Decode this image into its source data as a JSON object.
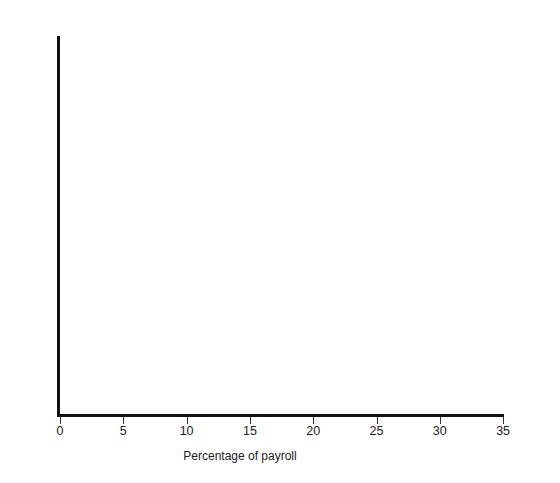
{
  "chart_data": {
    "type": "bar",
    "orientation": "horizontal",
    "stacked": true,
    "title": "",
    "xlabel": "Percentage of payroll",
    "ylabel": "",
    "xlim": [
      0,
      35
    ],
    "xticks": [
      0,
      5,
      10,
      15,
      20,
      25,
      30,
      35
    ],
    "grid": false,
    "legend_position": "right",
    "categories": [
      "1964",
      "1966",
      "1968",
      "1970",
      "1972",
      "1974",
      "1976",
      "1978",
      "1980",
      "1982",
      "1984"
    ],
    "series": [
      {
        "name": "A",
        "label": "Legally required payments",
        "values": [
          2.0,
          1.5,
          1.5,
          1.8,
          1.8,
          2.0,
          2.4,
          3.0,
          2.8,
          2.6,
          4.5
        ]
      },
      {
        "name": "B",
        "label": "Pension and other agreed-upon payments",
        "values": [
          8.7,
          7.7,
          9.5,
          10.6,
          11.4,
          10.5,
          10.5,
          12.7,
          13.5,
          12.7,
          10.4
        ]
      },
      {
        "name": "C",
        "label": "Paid rest periods, lunch periods, etc.",
        "values": [
          3.6,
          3.7,
          3.2,
          3.6,
          4.8,
          3.7,
          4.4,
          3.8,
          4.0,
          4.0,
          3.5
        ]
      },
      {
        "name": "D",
        "label": "Payments for time not worked",
        "values": [
          8.3,
          8.7,
          9.8,
          9.8,
          9.4,
          10.6,
          9.9,
          10.3,
          10.2,
          10.7,
          10.9
        ]
      },
      {
        "name": "E",
        "label": "Profit-sharing payments, bonuses, etc.",
        "values": [
          1.9,
          1.9,
          1.9,
          2.8,
          2.0,
          1.9,
          3.2,
          2.0,
          1.8,
          1.9,
          1.9
        ]
      }
    ],
    "totals": [
      24.5,
      23.5,
      25.9,
      28.6,
      29.4,
      28.7,
      30.4,
      31.8,
      32.3,
      31.9,
      31.2
    ]
  },
  "axis": {
    "x_title": "Percentage of payroll",
    "tick_labels": [
      "0",
      "5",
      "10",
      "15",
      "20",
      "25",
      "30",
      "35"
    ]
  },
  "column_headers": [
    "A",
    "B",
    "C",
    "D",
    "E"
  ],
  "legend": {
    "items": [
      {
        "key": "A:",
        "lines": [
          "Legally required payments"
        ]
      },
      {
        "key": "B:",
        "lines": [
          "Pension and other",
          "agreed-upon payments"
        ]
      },
      {
        "key": "C:",
        "lines": [
          "Paid rest periods,",
          "lunch periods, etc."
        ]
      },
      {
        "key": "D:",
        "lines": [
          "Payments for time not worked"
        ]
      },
      {
        "key": "E:",
        "lines": [
          "Profit-sharing payments,",
          "bonuses, etc."
        ]
      }
    ]
  },
  "colors": {
    "segment_a": "#7b7b7b",
    "segment_b": "#f2f2f2",
    "segment_c": "#d2d2d2",
    "segment_d": "#ffffff",
    "segment_e": "#ffffff",
    "axis": "#111111",
    "text": "#1a1a1a"
  }
}
